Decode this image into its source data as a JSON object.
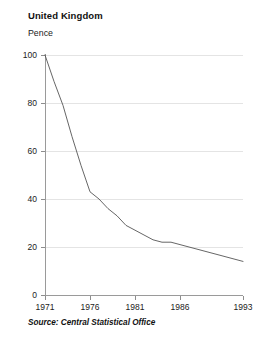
{
  "chart": {
    "title": "United Kingdom",
    "y_axis_label": "Pence",
    "source": "Source: Central Statistical Office"
  },
  "chart_data": {
    "type": "line",
    "title": "United Kingdom",
    "subtitle": "",
    "xlabel": "",
    "ylabel": "Pence",
    "xlim": [
      1971,
      1993
    ],
    "ylim": [
      0,
      100
    ],
    "grid": true,
    "legend": null,
    "xticks": [
      1971,
      1976,
      1981,
      1986,
      1993
    ],
    "xtick_labels": [
      "1971",
      "1976",
      "1981",
      "1986",
      "1993"
    ],
    "yticks": [
      0,
      20,
      40,
      60,
      80,
      100
    ],
    "ytick_labels": [
      "0",
      "20",
      "40",
      "60",
      "80",
      "100"
    ],
    "series": [
      {
        "name": "Purchasing power of the pound",
        "color": "#555555",
        "x": [
          1971,
          1972,
          1973,
          1974,
          1975,
          1976,
          1977,
          1978,
          1979,
          1980,
          1981,
          1982,
          1983,
          1984,
          1985,
          1986,
          1987,
          1988,
          1989,
          1990,
          1991,
          1992,
          1993
        ],
        "values": [
          100,
          89,
          79,
          66,
          54,
          43,
          40,
          36,
          33,
          29,
          27,
          25,
          23,
          22,
          22,
          21,
          20,
          19,
          18,
          17,
          16,
          15,
          14
        ]
      }
    ]
  }
}
